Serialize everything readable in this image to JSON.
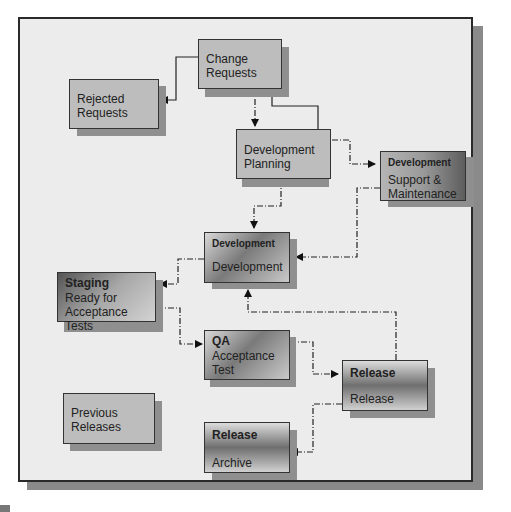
{
  "diagram": {
    "nodes": [
      {
        "id": "change_requests",
        "header": "",
        "label_line1": "Change",
        "label_line2": "Requests"
      },
      {
        "id": "rejected_requests",
        "header": "",
        "label_line1": "Rejected",
        "label_line2": "Requests"
      },
      {
        "id": "development_planning",
        "header": "",
        "label_line1": "Development",
        "label_line2": "Planning"
      },
      {
        "id": "support_maintenance",
        "header": "Development",
        "label_line1": "Support &",
        "label_line2": "Maintenance"
      },
      {
        "id": "development",
        "header": "Development",
        "label_line1": "Development",
        "label_line2": ""
      },
      {
        "id": "staging",
        "header": "Staging",
        "label_line1": "Ready for",
        "label_line2": "Acceptance Tests"
      },
      {
        "id": "qa",
        "header": "QA",
        "label_line1": "Acceptance",
        "label_line2": "Test"
      },
      {
        "id": "release",
        "header": "Release",
        "label_line1": "Release",
        "label_line2": ""
      },
      {
        "id": "previous_releases",
        "header": "",
        "label_line1": "Previous",
        "label_line2": "Releases"
      },
      {
        "id": "archive",
        "header": "Release",
        "label_line1": "Archive",
        "label_line2": ""
      }
    ],
    "edges": [
      {
        "from": "change_requests",
        "to": "rejected_requests",
        "style": "solid"
      },
      {
        "from": "change_requests",
        "to": "development_planning",
        "style": "dash-dot"
      },
      {
        "from": "development_planning",
        "to": "change_requests",
        "style": "solid"
      },
      {
        "from": "development_planning",
        "to": "support_maintenance",
        "style": "dash-dot"
      },
      {
        "from": "development_planning",
        "to": "development",
        "style": "dash-dot"
      },
      {
        "from": "support_maintenance",
        "to": "development",
        "style": "dash-dot"
      },
      {
        "from": "development",
        "to": "staging",
        "style": "dash-dot"
      },
      {
        "from": "staging",
        "to": "qa",
        "style": "dash-dot"
      },
      {
        "from": "qa",
        "to": "release",
        "style": "dash-dot"
      },
      {
        "from": "release",
        "to": "development",
        "style": "dash-dot"
      },
      {
        "from": "release",
        "to": "archive",
        "style": "dash-dot"
      }
    ]
  }
}
